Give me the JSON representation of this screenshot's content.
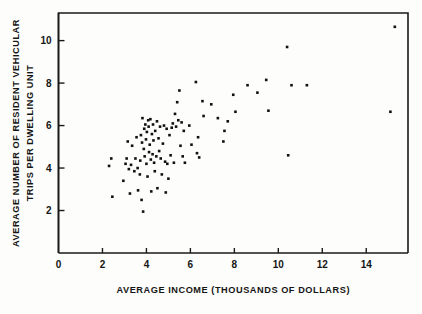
{
  "chart_data": {
    "type": "scatter",
    "title": "",
    "xlabel": "AVERAGE INCOME (THOUSANDS OF DOLLARS)",
    "ylabel_line1": "AVERAGE NUMBER OF RESIDENT VEHICULAR",
    "ylabel_line2": "TRIPS PER DWELLING UNIT",
    "xlim": [
      0,
      15.9
    ],
    "ylim": [
      0,
      11.3
    ],
    "xticks": [
      0,
      2,
      4,
      6,
      8,
      10,
      12,
      14
    ],
    "xticklabels": [
      "0",
      "2",
      "4",
      "6",
      "8",
      "10",
      "12",
      "14"
    ],
    "yticks": [
      2,
      4,
      6,
      8,
      10
    ],
    "yticklabels": [
      "2",
      "4",
      "6",
      "8",
      "10"
    ],
    "grid": false,
    "legend": null,
    "marker": "square",
    "marker_color": "#111111",
    "marker_size": 2.6,
    "points": [
      [
        2.3,
        4.1
      ],
      [
        2.4,
        4.45
      ],
      [
        2.45,
        2.65
      ],
      [
        2.95,
        3.4
      ],
      [
        3.05,
        4.2
      ],
      [
        3.1,
        4.45
      ],
      [
        3.15,
        5.25
      ],
      [
        3.2,
        3.95
      ],
      [
        3.25,
        2.8
      ],
      [
        3.3,
        4.15
      ],
      [
        3.35,
        5.05
      ],
      [
        3.45,
        3.85
      ],
      [
        3.5,
        4.45
      ],
      [
        3.55,
        5.45
      ],
      [
        3.6,
        4.0
      ],
      [
        3.62,
        2.95
      ],
      [
        3.7,
        3.7
      ],
      [
        3.72,
        4.35
      ],
      [
        3.75,
        5.55
      ],
      [
        3.78,
        2.5
      ],
      [
        3.8,
        5.2
      ],
      [
        3.82,
        6.35
      ],
      [
        3.85,
        1.95
      ],
      [
        3.88,
        4.9
      ],
      [
        3.9,
        5.85
      ],
      [
        3.92,
        4.55
      ],
      [
        3.95,
        6.05
      ],
      [
        3.98,
        5.35
      ],
      [
        4.0,
        4.2
      ],
      [
        4.02,
        5.7
      ],
      [
        4.05,
        3.6
      ],
      [
        4.08,
        6.25
      ],
      [
        4.1,
        5.95
      ],
      [
        4.12,
        4.75
      ],
      [
        4.15,
        5.1
      ],
      [
        4.18,
        6.3
      ],
      [
        4.2,
        4.4
      ],
      [
        4.22,
        2.9
      ],
      [
        4.25,
        5.6
      ],
      [
        4.28,
        4.65
      ],
      [
        4.3,
        6.05
      ],
      [
        4.32,
        5.3
      ],
      [
        4.35,
        4.25
      ],
      [
        4.38,
        3.85
      ],
      [
        4.4,
        5.75
      ],
      [
        4.45,
        4.55
      ],
      [
        4.48,
        6.2
      ],
      [
        4.5,
        3.05
      ],
      [
        4.55,
        5.4
      ],
      [
        4.58,
        4.8
      ],
      [
        4.62,
        5.95
      ],
      [
        4.65,
        4.45
      ],
      [
        4.7,
        3.7
      ],
      [
        4.75,
        5.15
      ],
      [
        4.8,
        6.0
      ],
      [
        4.85,
        4.3
      ],
      [
        4.88,
        2.85
      ],
      [
        4.92,
        5.85
      ],
      [
        4.95,
        4.2
      ],
      [
        5.0,
        3.5
      ],
      [
        5.05,
        5.55
      ],
      [
        5.1,
        4.6
      ],
      [
        5.15,
        5.9
      ],
      [
        5.2,
        6.1
      ],
      [
        5.25,
        4.25
      ],
      [
        5.3,
        6.55
      ],
      [
        5.35,
        5.95
      ],
      [
        5.4,
        7.1
      ],
      [
        5.45,
        6.25
      ],
      [
        5.5,
        7.65
      ],
      [
        5.55,
        5.05
      ],
      [
        5.6,
        6.15
      ],
      [
        5.65,
        4.55
      ],
      [
        5.7,
        5.75
      ],
      [
        5.75,
        4.25
      ],
      [
        5.95,
        6.0
      ],
      [
        6.05,
        5.1
      ],
      [
        6.25,
        8.05
      ],
      [
        6.3,
        4.7
      ],
      [
        6.35,
        5.45
      ],
      [
        6.4,
        4.5
      ],
      [
        6.55,
        7.15
      ],
      [
        6.6,
        6.45
      ],
      [
        6.95,
        7.0
      ],
      [
        7.25,
        6.35
      ],
      [
        7.5,
        5.25
      ],
      [
        7.55,
        5.75
      ],
      [
        7.7,
        6.2
      ],
      [
        7.95,
        7.45
      ],
      [
        8.05,
        6.65
      ],
      [
        8.6,
        7.9
      ],
      [
        9.05,
        7.55
      ],
      [
        9.45,
        8.15
      ],
      [
        9.55,
        6.7
      ],
      [
        10.4,
        9.7
      ],
      [
        10.45,
        4.6
      ],
      [
        10.6,
        7.9
      ],
      [
        11.3,
        7.9
      ],
      [
        15.1,
        6.65
      ],
      [
        15.3,
        10.65
      ]
    ]
  }
}
